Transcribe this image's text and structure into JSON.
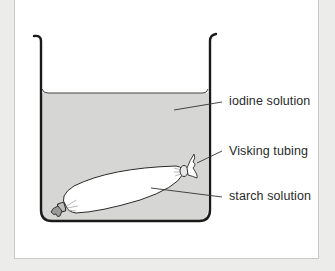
{
  "diagram": {
    "labels": {
      "iodine": "iodine solution",
      "visking": "Visking tubing",
      "starch": "starch solution"
    },
    "colors": {
      "background": "#ececea",
      "panel": "#ffffff",
      "liquid": "#d6d6d4",
      "outline": "#1a1a1a",
      "tubing": "#ffffff"
    }
  }
}
